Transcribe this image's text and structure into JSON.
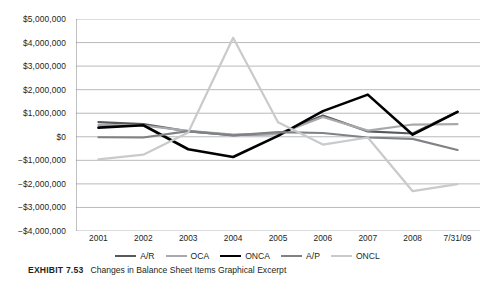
{
  "chart_data": {
    "type": "line",
    "title": "",
    "xlabel": "",
    "ylabel": "",
    "categories": [
      "2001",
      "2002",
      "2003",
      "2004",
      "2005",
      "2006",
      "2007",
      "2008",
      "7/31/09"
    ],
    "ylim": [
      -4000000,
      5000000
    ],
    "ytick_step": 1000000,
    "ytick_labels": [
      "$5,000,000",
      "$4,000,000",
      "$3,000,000",
      "$2,000,000",
      "$1,000,000",
      "$0",
      "−$1,000,000",
      "−$2,000,000",
      "−$3,000,000",
      "−$4,000,000"
    ],
    "ytick_values": [
      5000000,
      4000000,
      3000000,
      2000000,
      1000000,
      0,
      -1000000,
      -2000000,
      -3000000,
      -4000000
    ],
    "grid": "horizontal",
    "legend_position": "bottom",
    "series": [
      {
        "name": "A/R",
        "color": "#58595b",
        "width": 2.2,
        "values": [
          620000,
          540000,
          230000,
          70000,
          120000,
          900000,
          230000,
          140000,
          1060000
        ]
      },
      {
        "name": "OCA",
        "color": "#a7a9ac",
        "width": 2.2,
        "values": [
          500000,
          480000,
          250000,
          90000,
          110000,
          840000,
          260000,
          520000,
          540000
        ]
      },
      {
        "name": "ONCA",
        "color": "#000000",
        "width": 2.6,
        "values": [
          390000,
          490000,
          -530000,
          -860000,
          40000,
          1090000,
          1790000,
          90000,
          1060000
        ]
      },
      {
        "name": "A/P",
        "color": "#808285",
        "width": 2.2,
        "values": [
          -20000,
          -30000,
          240000,
          60000,
          200000,
          160000,
          -30000,
          -90000,
          -560000
        ]
      },
      {
        "name": "ONCL",
        "color": "#c9cacc",
        "width": 2.2,
        "values": [
          -960000,
          -760000,
          180000,
          4200000,
          620000,
          -330000,
          -30000,
          -2310000,
          -2010000
        ]
      }
    ]
  },
  "axis": {
    "ylabels": [
      "$5,000,000",
      "$4,000,000",
      "$3,000,000",
      "$2,000,000",
      "$1,000,000",
      "$0",
      "−$1,000,000",
      "−$2,000,000",
      "−$3,000,000",
      "−$4,000,000"
    ],
    "xlabels": [
      "2001",
      "2002",
      "2003",
      "2004",
      "2005",
      "2006",
      "2007",
      "2008",
      "7/31/09"
    ]
  },
  "legend": {
    "items": [
      {
        "label": "A/R",
        "color": "#58595b"
      },
      {
        "label": "OCA",
        "color": "#a7a9ac"
      },
      {
        "label": "ONCA",
        "color": "#000000"
      },
      {
        "label": "A/P",
        "color": "#808285"
      },
      {
        "label": "ONCL",
        "color": "#c9cacc"
      }
    ]
  },
  "caption": {
    "number": "EXHIBIT 7.53",
    "text": "Changes in Balance Sheet Items Graphical Excerpt"
  },
  "style": {
    "grid_color": "#a6a8ab",
    "axis_color": "#808285",
    "text_color": "#231f20",
    "background": "#ffffff"
  }
}
